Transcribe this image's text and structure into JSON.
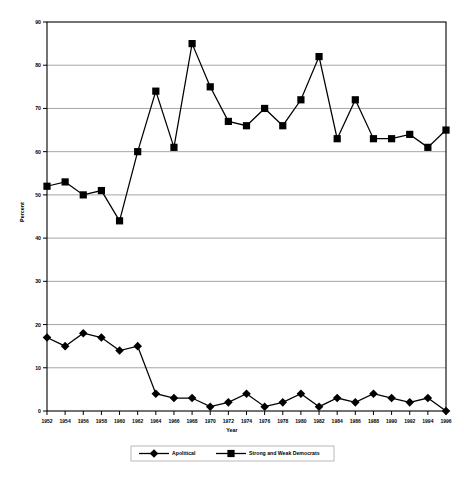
{
  "chart_data": {
    "type": "line",
    "title": "",
    "xlabel": "Year",
    "ylabel": "Percent",
    "ylim": [
      0,
      90
    ],
    "ytick_step": 10,
    "grid": "horizontal",
    "legend_position": "bottom",
    "categories": [
      1952,
      1954,
      1956,
      1958,
      1960,
      1962,
      1964,
      1966,
      1968,
      1970,
      1972,
      1974,
      1976,
      1978,
      1980,
      1982,
      1984,
      1986,
      1988,
      1990,
      1992,
      1994,
      1996
    ],
    "xtick_labels": [
      "1952",
      "1954",
      "1956",
      "1958",
      "1960",
      "1962",
      "1964",
      "1966",
      "1968",
      "1970",
      "1972",
      "1974",
      "1976",
      "1978",
      "1980",
      "1982",
      "1984",
      "1986",
      "1988",
      "1990",
      "1992",
      "1994",
      "1996"
    ],
    "ytick_labels": [
      "0",
      "10",
      "20",
      "30",
      "40",
      "50",
      "60",
      "70",
      "80",
      "90"
    ],
    "series": [
      {
        "name": "Apolitical",
        "marker": "diamond",
        "color": "#000000",
        "values": [
          17,
          15,
          18,
          17,
          14,
          15,
          4,
          3,
          3,
          1,
          2,
          4,
          1,
          2,
          4,
          1,
          3,
          2,
          4,
          3,
          2,
          3,
          0
        ]
      },
      {
        "name": "Strong and Weak Democrats",
        "marker": "square",
        "color": "#000000",
        "values": [
          52,
          53,
          50,
          51,
          44,
          60,
          74,
          61,
          85,
          75,
          67,
          66,
          70,
          66,
          72,
          82,
          63,
          72,
          63,
          63,
          64,
          61,
          65
        ]
      }
    ]
  },
  "legend": {
    "items": [
      {
        "label": "Apolitical"
      },
      {
        "label": "Strong and Weak Democrats"
      }
    ]
  },
  "axes": {
    "x_title": "Year",
    "y_title": "Percent"
  }
}
